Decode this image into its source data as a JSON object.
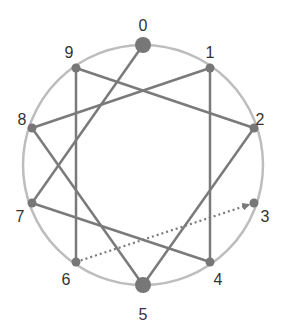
{
  "diagram": {
    "title": "",
    "circle": {
      "cx": 143,
      "cy": 165,
      "r": 120,
      "color": "#bdbdbd"
    },
    "edge_color": "#7a7a7a",
    "node_color": "#777777",
    "nodes": [
      {
        "id": "0",
        "label": "0",
        "x": 143,
        "y": 45,
        "lx": 143,
        "ly": 27,
        "big": true
      },
      {
        "id": "1",
        "label": "1",
        "x": 210,
        "y": 68,
        "lx": 210,
        "ly": 54,
        "big": false
      },
      {
        "id": "2",
        "label": "2",
        "x": 254,
        "y": 128,
        "lx": 260,
        "ly": 121,
        "big": false
      },
      {
        "id": "3",
        "label": "3",
        "x": 254,
        "y": 203,
        "lx": 265,
        "ly": 218,
        "big": false
      },
      {
        "id": "4",
        "label": "4",
        "x": 210,
        "y": 262,
        "lx": 218,
        "ly": 281,
        "big": false
      },
      {
        "id": "5",
        "label": "5",
        "x": 143,
        "y": 285,
        "lx": 143,
        "ly": 316,
        "big": true
      },
      {
        "id": "6",
        "label": "6",
        "x": 76,
        "y": 262,
        "lx": 66,
        "ly": 281,
        "big": false
      },
      {
        "id": "7",
        "label": "7",
        "x": 32,
        "y": 203,
        "lx": 20,
        "ly": 218,
        "big": false
      },
      {
        "id": "8",
        "label": "8",
        "x": 32,
        "y": 128,
        "lx": 22,
        "ly": 121,
        "big": false
      },
      {
        "id": "9",
        "label": "9",
        "x": 76,
        "y": 68,
        "lx": 69,
        "ly": 54,
        "big": false
      }
    ],
    "edges": [
      {
        "from": "0",
        "to": "7",
        "style": "solid"
      },
      {
        "from": "7",
        "to": "4",
        "style": "solid"
      },
      {
        "from": "4",
        "to": "1",
        "style": "solid"
      },
      {
        "from": "1",
        "to": "8",
        "style": "solid"
      },
      {
        "from": "8",
        "to": "5",
        "style": "solid"
      },
      {
        "from": "5",
        "to": "2",
        "style": "solid"
      },
      {
        "from": "2",
        "to": "9",
        "style": "solid"
      },
      {
        "from": "9",
        "to": "6",
        "style": "solid"
      },
      {
        "from": "6",
        "to": "3",
        "style": "dotted-arrow"
      }
    ]
  }
}
